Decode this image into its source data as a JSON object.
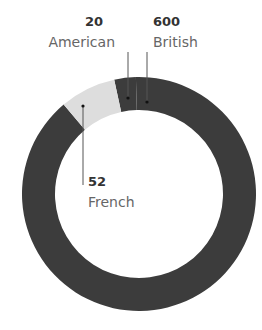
{
  "chart_data": {
    "type": "pie",
    "variant": "donut",
    "title": "",
    "slices": [
      {
        "label": "American",
        "value": 20,
        "color": "#3c3c3c"
      },
      {
        "label": "British",
        "value": 600,
        "color": "#3c3c3c"
      },
      {
        "label": "French",
        "value": 52,
        "color": "#dddddd"
      }
    ],
    "annotations": [
      {
        "value_text": "20",
        "label": "American"
      },
      {
        "value_text": "600",
        "label": "British"
      },
      {
        "value_text": "52",
        "label": "French"
      }
    ]
  }
}
